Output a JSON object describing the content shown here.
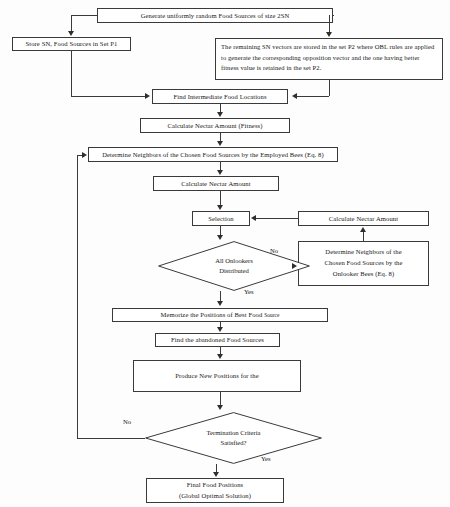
{
  "diagram": {
    "type": "flowchart",
    "canvas": {
      "width": 450,
      "height": 507
    },
    "colors": {
      "stroke": "#3a3a3a",
      "arrow": "#2e2e2e",
      "text": "#161616",
      "background": "#fdfdfd",
      "node_fill": "#ffffff"
    }
  },
  "nodes": {
    "generate": {
      "label": "Generate uniformly random Food Sources of size 2SN",
      "shape": "process"
    },
    "store_p1": {
      "label": "Store SN, Food Sources in Set P1",
      "shape": "process"
    },
    "obl_p2": {
      "label": "The remaining SN vectors are stored in the set P2 where OBL rules are applied to generate the corresponding opposition vector and the one having better fitness value is retained in the set P2.",
      "shape": "process"
    },
    "find_intermediate": {
      "label": "Find Intermediate Food Locations",
      "shape": "process"
    },
    "calc_fitness": {
      "label": "Calculate Nectar Amount (Fitness)",
      "shape": "process"
    },
    "employed": {
      "label": "Determine Neighbors of the Chosen Food Sources by the Employed Bees (Eq. 8)",
      "shape": "process"
    },
    "calc_nectar_1": {
      "label": "Calculate Nectar Amount",
      "shape": "process"
    },
    "selection": {
      "label": "Selection",
      "shape": "process"
    },
    "calc_nectar_2": {
      "label": "Calculate Nectar Amount",
      "shape": "process"
    },
    "onlooker": {
      "line1": "Determine Neighbors of the",
      "line2": "Chosen Food Sources by the",
      "line3": "Onlooker Bees (Eq. 8)",
      "shape": "process"
    },
    "all_onlookers": {
      "line1": "All Onlookers",
      "line2": "Distributed",
      "shape": "decision"
    },
    "memorize": {
      "prefix": "Memorize the Positions of Best Food ",
      "suffix": "Source",
      "shape": "process"
    },
    "find_abandoned": {
      "label": "Find the abandoned Food Sources",
      "shape": "process"
    },
    "produce_new": {
      "label": "Produce New Positions for the",
      "shape": "process"
    },
    "termination": {
      "line1": "Termination Criteria",
      "line2": "Satisfied?",
      "shape": "decision"
    },
    "final": {
      "line1": "Final Food Positions",
      "line2": "(Global Optimal Solution)",
      "shape": "process"
    }
  },
  "edge_labels": {
    "onlookers_no": "No",
    "onlookers_yes": "Yes",
    "termination_no": "No",
    "termination_yes": "Yes"
  }
}
